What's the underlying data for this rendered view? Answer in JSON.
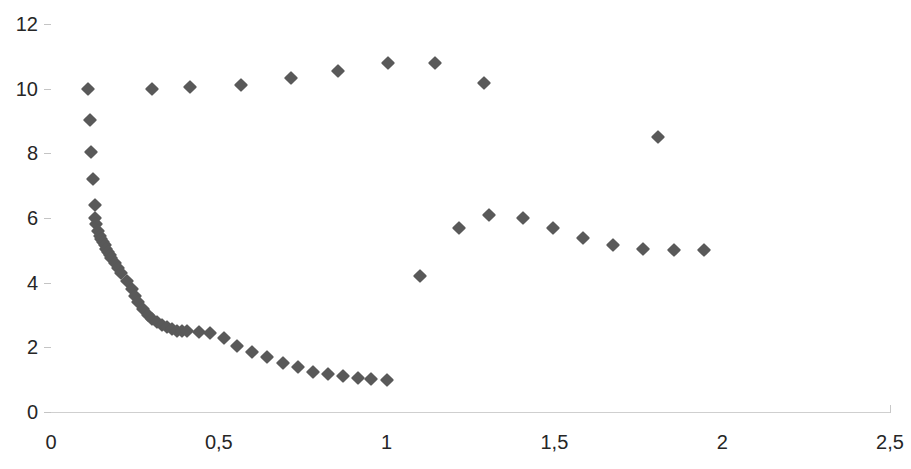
{
  "chart_data": {
    "type": "scatter",
    "title": "",
    "subtitle": "",
    "xlabel": "",
    "ylabel": "",
    "xlim": [
      0,
      2.5
    ],
    "ylim": [
      0,
      12
    ],
    "grid": true,
    "grid_axis": "y",
    "legend": false,
    "legend_position": "none",
    "marker": "diamond",
    "marker_color": "#595959",
    "marker_size": 10,
    "decimal_separator": ",",
    "x_ticks": [
      0,
      0.5,
      1,
      1.5,
      2,
      2.5
    ],
    "x_tick_labels": [
      "0",
      "0,5",
      "1",
      "1,5",
      "2",
      "2,5"
    ],
    "y_ticks": [
      0,
      2,
      4,
      6,
      8,
      10,
      12
    ],
    "y_tick_labels": [
      "0",
      "2",
      "4",
      "6",
      "8",
      "10",
      "12"
    ],
    "series": [
      {
        "name": "upper-branch",
        "points": [
          [
            0.11,
            10.0
          ],
          [
            0.3,
            10.0
          ],
          [
            0.415,
            10.05
          ],
          [
            0.565,
            10.12
          ],
          [
            0.715,
            10.32
          ],
          [
            0.855,
            10.55
          ],
          [
            1.005,
            10.78
          ],
          [
            1.145,
            10.78
          ],
          [
            1.29,
            10.18
          ]
        ]
      },
      {
        "name": "lower-decay-branch",
        "points": [
          [
            0.115,
            9.02
          ],
          [
            0.12,
            8.05
          ],
          [
            0.125,
            7.2
          ],
          [
            0.13,
            6.4
          ],
          [
            0.132,
            6.0
          ],
          [
            0.134,
            5.8
          ],
          [
            0.14,
            5.6
          ],
          [
            0.145,
            5.45
          ],
          [
            0.15,
            5.35
          ],
          [
            0.155,
            5.25
          ],
          [
            0.16,
            5.15
          ],
          [
            0.165,
            5.05
          ],
          [
            0.17,
            4.95
          ],
          [
            0.175,
            4.85
          ],
          [
            0.18,
            4.75
          ],
          [
            0.19,
            4.6
          ],
          [
            0.2,
            4.45
          ],
          [
            0.21,
            4.3
          ],
          [
            0.225,
            4.05
          ],
          [
            0.24,
            3.8
          ],
          [
            0.25,
            3.6
          ],
          [
            0.26,
            3.4
          ],
          [
            0.275,
            3.2
          ],
          [
            0.29,
            3.0
          ],
          [
            0.3,
            2.88
          ],
          [
            0.315,
            2.78
          ],
          [
            0.33,
            2.7
          ],
          [
            0.345,
            2.62
          ],
          [
            0.36,
            2.56
          ],
          [
            0.375,
            2.52
          ],
          [
            0.39,
            2.5
          ],
          [
            0.405,
            2.5
          ],
          [
            0.44,
            2.48
          ],
          [
            0.475,
            2.45
          ],
          [
            0.515,
            2.28
          ],
          [
            0.555,
            2.05
          ],
          [
            0.6,
            1.85
          ],
          [
            0.645,
            1.7
          ],
          [
            0.69,
            1.52
          ],
          [
            0.735,
            1.38
          ],
          [
            0.78,
            1.25
          ],
          [
            0.825,
            1.18
          ],
          [
            0.87,
            1.1
          ],
          [
            0.915,
            1.05
          ],
          [
            0.955,
            1.02
          ],
          [
            1.0,
            1.0
          ]
        ]
      },
      {
        "name": "middle-branch",
        "points": [
          [
            1.1,
            4.22
          ],
          [
            1.215,
            5.68
          ],
          [
            1.305,
            6.08
          ],
          [
            1.405,
            6.0
          ],
          [
            1.495,
            5.7
          ],
          [
            1.585,
            5.38
          ],
          [
            1.675,
            5.18
          ],
          [
            1.765,
            5.05
          ],
          [
            1.855,
            5.02
          ],
          [
            1.945,
            5.0
          ]
        ]
      },
      {
        "name": "outlier",
        "points": [
          [
            1.81,
            8.5
          ]
        ]
      }
    ]
  },
  "axis_colors": {
    "gridline": "#d9d9d9",
    "tick_label": "#262626",
    "background": "#ffffff"
  }
}
